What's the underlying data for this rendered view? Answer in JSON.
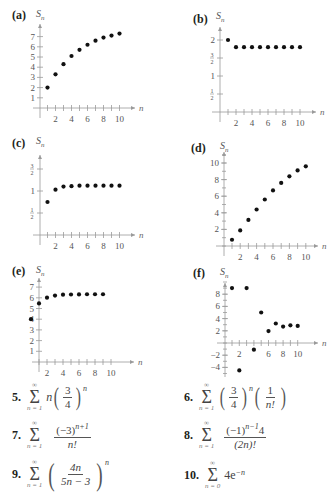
{
  "chart_data": [
    {
      "id": "a",
      "type": "scatter",
      "label": "(a)",
      "ylabel": "S_n",
      "xlabel": "n",
      "x": [
        1,
        2,
        3,
        4,
        5,
        6,
        7,
        8,
        9,
        10
      ],
      "values": [
        2.0,
        3.3,
        4.3,
        5.1,
        5.7,
        6.2,
        6.6,
        6.9,
        7.1,
        7.3
      ],
      "xticks": [
        "2",
        "4",
        "6",
        "8",
        "10"
      ],
      "yticks": [
        "1",
        "2",
        "3",
        "4",
        "5",
        "6",
        "7"
      ],
      "xlim": [
        0,
        10
      ],
      "ylim": [
        0,
        7.5
      ],
      "grid": false
    },
    {
      "id": "b",
      "type": "scatter",
      "label": "(b)",
      "ylabel": "S_n",
      "xlabel": "n",
      "x": [
        1,
        2,
        3,
        4,
        5,
        6,
        7,
        8,
        9,
        10
      ],
      "values": [
        2.0,
        1.8,
        1.8,
        1.8,
        1.8,
        1.8,
        1.8,
        1.8,
        1.8,
        1.8
      ],
      "xticks": [
        "2",
        "4",
        "6",
        "8",
        "10"
      ],
      "yticks": [
        "1/2",
        "1",
        "3/2",
        "2"
      ],
      "xlim": [
        0,
        10
      ],
      "ylim": [
        0,
        2.2
      ],
      "grid": false
    },
    {
      "id": "c",
      "type": "scatter",
      "label": "(c)",
      "ylabel": "S_n",
      "xlabel": "n",
      "x": [
        1,
        2,
        3,
        4,
        5,
        6,
        7,
        8,
        9,
        10
      ],
      "values": [
        0.75,
        1.03,
        1.1,
        1.11,
        1.12,
        1.12,
        1.12,
        1.12,
        1.12,
        1.12
      ],
      "xticks": [
        "2",
        "4",
        "6",
        "8",
        "10"
      ],
      "yticks": [
        "1/2",
        "1",
        "3/2"
      ],
      "xlim": [
        0,
        10
      ],
      "ylim": [
        0,
        1.7
      ],
      "grid": false
    },
    {
      "id": "d",
      "type": "scatter",
      "label": "(d)",
      "ylabel": "S_n",
      "xlabel": "n",
      "x": [
        1,
        2,
        3,
        4,
        5,
        6,
        7,
        8,
        9,
        10
      ],
      "values": [
        0.75,
        1.875,
        3.14,
        4.4,
        5.6,
        6.7,
        7.6,
        8.4,
        9.1,
        9.6
      ],
      "xticks": [
        "2",
        "4",
        "6",
        "8",
        "10"
      ],
      "yticks": [
        "2",
        "4",
        "6",
        "8",
        "10"
      ],
      "xlim": [
        0,
        10
      ],
      "ylim": [
        0,
        11
      ],
      "grid": false
    },
    {
      "id": "e",
      "type": "scatter",
      "label": "(e)",
      "ylabel": "S_n",
      "xlabel": "n",
      "x": [
        0,
        1,
        2,
        3,
        4,
        5,
        6,
        7,
        8,
        9
      ],
      "values": [
        4.0,
        5.47,
        6.01,
        6.21,
        6.29,
        6.31,
        6.32,
        6.33,
        6.33,
        6.33
      ],
      "xticks": [
        "2",
        "4",
        "6",
        "8",
        "10"
      ],
      "yticks": [
        "1",
        "2",
        "3",
        "4",
        "5",
        "6",
        "7"
      ],
      "xlim": [
        0,
        10
      ],
      "ylim": [
        0,
        7.5
      ],
      "grid": false
    },
    {
      "id": "f",
      "type": "scatter",
      "label": "(f)",
      "ylabel": "S_n",
      "xlabel": "n",
      "x": [
        1,
        2,
        3,
        4,
        5,
        6,
        7,
        8,
        9,
        10
      ],
      "values": [
        9.0,
        -4.5,
        9.0,
        -1.1,
        5.0,
        1.95,
        3.2,
        2.7,
        2.9,
        2.8
      ],
      "xticks": [
        "2",
        "6",
        "8",
        "10"
      ],
      "yticks": [
        "-4",
        "-2",
        "2",
        "4",
        "6",
        "8"
      ],
      "xlim": [
        0,
        10
      ],
      "ylim": [
        -5,
        10
      ],
      "grid": false
    }
  ],
  "panels": {
    "a": {
      "label": "(a)",
      "sn": "S",
      "sub": "n"
    },
    "b": {
      "label": "(b)",
      "sn": "S",
      "sub": "n"
    },
    "c": {
      "label": "(c)",
      "sn": "S",
      "sub": "n"
    },
    "d": {
      "label": "(d)",
      "sn": "S",
      "sub": "n"
    },
    "e": {
      "label": "(e)",
      "sn": "S",
      "sub": "n"
    },
    "f": {
      "label": "(f)",
      "sn": "S",
      "sub": "n"
    }
  },
  "problems": [
    {
      "num": "5.",
      "upper": "∞",
      "lower": "n = 1",
      "expr": "n(3/4)^n"
    },
    {
      "num": "6.",
      "upper": "∞",
      "lower": "n = 1",
      "expr": "(3/4)^n (1/n!)"
    },
    {
      "num": "7.",
      "upper": "∞",
      "lower": "n = 1",
      "expr": "(−3)^(n+1) / n!"
    },
    {
      "num": "8.",
      "upper": "∞",
      "lower": "n = 1",
      "expr": "(−1)^(n−1) 4 / (2n)!"
    },
    {
      "num": "9.",
      "upper": "∞",
      "lower": "n = 1",
      "expr": "(4n / (5n − 3))^n"
    },
    {
      "num": "10.",
      "upper": "∞",
      "lower": "n = 0",
      "expr": "4e^(−n)"
    }
  ],
  "text": {
    "sigma": "Σ",
    "p5": {
      "n": "n",
      "num": "3",
      "den": "4",
      "exp": "n"
    },
    "p6": {
      "num1": "3",
      "den1": "4",
      "exp": "n",
      "num2": "1",
      "den2": "n!"
    },
    "p7": {
      "num": "(−3)",
      "exp": "n+1",
      "den": "n!"
    },
    "p8": {
      "num": "(−1)",
      "exp": "n−1",
      "num_tail": "4",
      "den": "(2n)!"
    },
    "p9": {
      "num": "4n",
      "den": "5n − 3",
      "exp": "n"
    },
    "p10": {
      "base": "4e",
      "exp": "−n"
    }
  }
}
